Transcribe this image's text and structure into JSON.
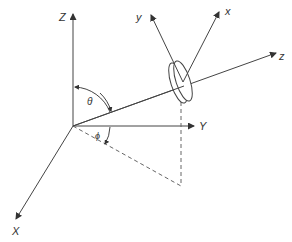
{
  "diagram": {
    "type": "3d-coordinate-geometry",
    "labels": {
      "Z": "Z",
      "Y": "Y",
      "X": "X",
      "z": "z",
      "y": "y",
      "x": "x",
      "theta": "θ",
      "phi": "ϕ"
    },
    "colors": {
      "line": "#444444",
      "dashed": "#666666",
      "text": "#333333"
    }
  }
}
